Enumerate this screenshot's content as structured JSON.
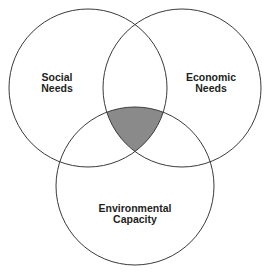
{
  "diagram": {
    "type": "venn-3-circle",
    "background_color": "#ffffff",
    "stroke_color": "#3a3a3a",
    "stroke_width": 1,
    "text_color": "#231f20",
    "center_fill_color": "#8a8a8a",
    "canvas": {
      "width": 270,
      "height": 276
    },
    "circles": [
      {
        "id": "social",
        "label_line1": "Social",
        "label_line2": "Needs",
        "cx": 88,
        "cy": 88,
        "r": 79,
        "label_x": 57,
        "label_y": 78
      },
      {
        "id": "economic",
        "label_line1": "Economic",
        "label_line2": "Needs",
        "cx": 182,
        "cy": 88,
        "r": 79,
        "label_x": 211,
        "label_y": 78
      },
      {
        "id": "environmental",
        "label_line1": "Environmental",
        "label_line2": "Capacity",
        "cx": 135,
        "cy": 186,
        "r": 79,
        "label_x": 135,
        "label_y": 209
      }
    ],
    "intersection": {
      "id": "sustainability-core",
      "fill": "#8a8a8a",
      "vertices": [
        {
          "x": 103,
          "y": 105
        },
        {
          "x": 167,
          "y": 105
        },
        {
          "x": 135,
          "y": 152
        }
      ],
      "label": ""
    }
  }
}
